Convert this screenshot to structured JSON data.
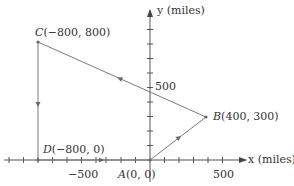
{
  "diagram": {
    "type": "coordinate-plane-path",
    "axes": {
      "x_label": "x (miles)",
      "y_label": "y (miles)",
      "x_tick_label": "500",
      "x_neg_tick_label": "−500",
      "y_tick_label": "500",
      "tick_spacing_miles": 100
    },
    "points": [
      {
        "id": "A",
        "letter": "A",
        "coords": "(0, 0)",
        "x": 0,
        "y": 0
      },
      {
        "id": "B",
        "letter": "B",
        "coords": "(400, 300)",
        "x": 400,
        "y": 300
      },
      {
        "id": "C",
        "letter": "C",
        "coords": "(−800, 800)",
        "x": -800,
        "y": 800
      },
      {
        "id": "D",
        "letter": "D",
        "coords": "(−800, 0)",
        "x": -800,
        "y": 0
      }
    ],
    "path": [
      "A",
      "B",
      "C",
      "D",
      "A"
    ],
    "colors": {
      "path": "#7a7a7a",
      "axis": "#555555",
      "text": "#333333"
    }
  }
}
